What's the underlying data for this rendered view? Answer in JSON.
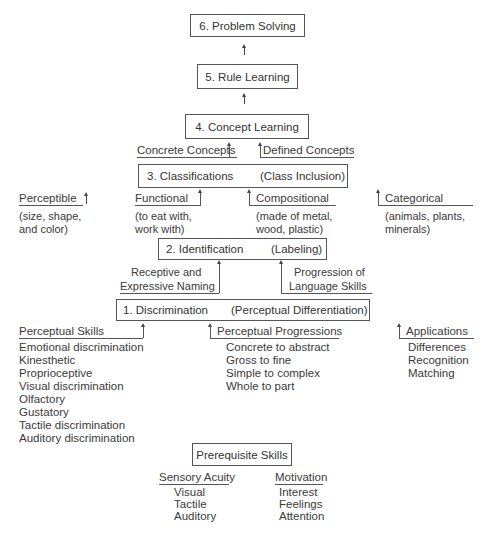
{
  "levels": {
    "l6": "6.  Problem Solving",
    "l5": "5.  Rule Learning",
    "l4": "4.  Concept Learning",
    "l3_left": "3.  Classifications",
    "l3_right": "(Class Inclusion)",
    "l2_left": "2.  Identification",
    "l2_right": "(Labeling)",
    "l1_left": "1.  Discrimination",
    "l1_right": "(Perceptual Differentiation)",
    "prereq": "Prerequisite Skills"
  },
  "concepts": {
    "concrete": "Concrete Concepts",
    "defined": "Defined Concepts"
  },
  "classification_types": [
    {
      "title": "Perceptible",
      "desc": [
        "(size, shape,",
        "and color)"
      ]
    },
    {
      "title": "Functional",
      "desc": [
        "(to eat with,",
        "work with)"
      ]
    },
    {
      "title": "Compositional",
      "desc": [
        "(made of metal,",
        "wood, plastic)"
      ]
    },
    {
      "title": "Categorical",
      "desc": [
        "(animals, plants,",
        "minerals)"
      ]
    }
  ],
  "identification": {
    "left": [
      "Receptive and",
      "Expressive Naming"
    ],
    "right": [
      "Progression of",
      "Language Skills"
    ]
  },
  "discrimination": {
    "perceptual_skills": {
      "title": "Perceptual Skills",
      "items": [
        "Emotional discrimination",
        "Kinesthetic",
        "Proprioceptive",
        "Visual discrimination",
        "Olfactory",
        "Gustatory",
        "Tactile discrimination",
        "Auditory discrimination"
      ]
    },
    "perceptual_progressions": {
      "title": "Perceptual Progressions",
      "items": [
        "Concrete to abstract",
        "Gross to fine",
        "Simple to complex",
        "Whole to part"
      ]
    },
    "applications": {
      "title": "Applications",
      "items": [
        "Differences",
        "Recognition",
        "Matching"
      ]
    }
  },
  "prerequisites": {
    "sensory_acuity": {
      "title": "Sensory Acuity",
      "items": [
        "Visual",
        "Tactile",
        "Auditory"
      ]
    },
    "motivation": {
      "title": "Motivation",
      "items": [
        "Interest",
        "Feelings",
        "Attention"
      ]
    }
  }
}
